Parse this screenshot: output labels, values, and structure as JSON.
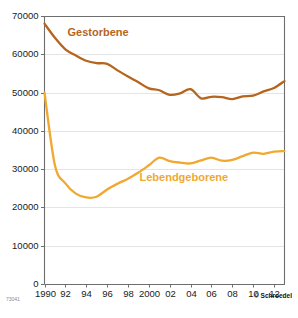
{
  "chart_data": {
    "type": "line",
    "title": "",
    "xlabel": "",
    "ylabel": "",
    "ylim": [
      0,
      70000
    ],
    "xlim": [
      1990,
      2013
    ],
    "grid": true,
    "legend_position": "inline-annotation",
    "y_ticks": [
      0,
      10000,
      20000,
      30000,
      40000,
      50000,
      60000,
      70000
    ],
    "y_tick_labels": [
      "0",
      "10000",
      "20000",
      "30000",
      "40000",
      "50000",
      "60000",
      "70000"
    ],
    "x_ticks": [
      1990,
      1992,
      1994,
      1996,
      1998,
      2000,
      2002,
      2004,
      2006,
      2008,
      2010,
      2012
    ],
    "x_tick_labels": [
      "1990",
      "92",
      "94",
      "96",
      "98",
      "2000",
      "02",
      "04",
      "06",
      "08",
      "10",
      "12"
    ],
    "x": [
      1990,
      1991,
      1992,
      1993,
      1994,
      1995,
      1996,
      1997,
      1998,
      1999,
      2000,
      2001,
      2002,
      2003,
      2004,
      2005,
      2006,
      2007,
      2008,
      2009,
      2010,
      2011,
      2012,
      2013
    ],
    "series": [
      {
        "name": "Gestorbene",
        "color": "#B5651D",
        "label_color": "#B5651D",
        "values": [
          68000,
          64300,
          61300,
          59700,
          58300,
          57700,
          57500,
          55800,
          54200,
          52700,
          51100,
          50600,
          49400,
          49800,
          50900,
          48500,
          48900,
          48800,
          48300,
          49000,
          49200,
          50300,
          51200,
          53000
        ]
      },
      {
        "name": "Lebendgeborene",
        "color": "#F0A830",
        "label_color": "#F0A830",
        "values": [
          50000,
          31000,
          26300,
          23600,
          22600,
          22800,
          24700,
          26200,
          27500,
          29100,
          31000,
          33000,
          32100,
          31700,
          31500,
          32300,
          33000,
          32200,
          32400,
          33400,
          34300,
          34000,
          34600,
          34700
        ]
      }
    ],
    "annotations": [
      {
        "text": "Gestorbene",
        "x": 1992.2,
        "y": 64800,
        "color": "#B5651D"
      },
      {
        "text": "Lebendgeborene",
        "x": 1999.1,
        "y": 26900,
        "color": "#F0A830"
      }
    ]
  },
  "credit": {
    "copyright": "© Schroedel",
    "code": "73041"
  },
  "colors": {
    "deaths": "#B5651D",
    "births": "#F0A830",
    "grid": "#d8d8d8",
    "axis": "#6e6e6e",
    "text": "#1a1a1a",
    "background": "#ffffff"
  }
}
